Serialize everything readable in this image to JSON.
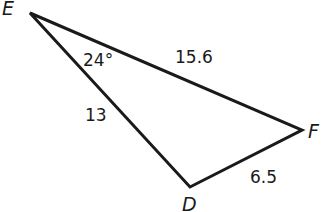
{
  "diagram": {
    "type": "triangle",
    "vertices": [
      {
        "name": "E",
        "label": "E"
      },
      {
        "name": "F",
        "label": "F"
      },
      {
        "name": "D",
        "label": "D"
      }
    ],
    "sides": [
      {
        "between": "E-F",
        "label": "15.6"
      },
      {
        "between": "E-D",
        "label": "13"
      },
      {
        "between": "D-F",
        "label": "6.5"
      }
    ],
    "angles": [
      {
        "at": "E",
        "label": "24°"
      }
    ],
    "stroke_color": "#1a1a1a"
  }
}
